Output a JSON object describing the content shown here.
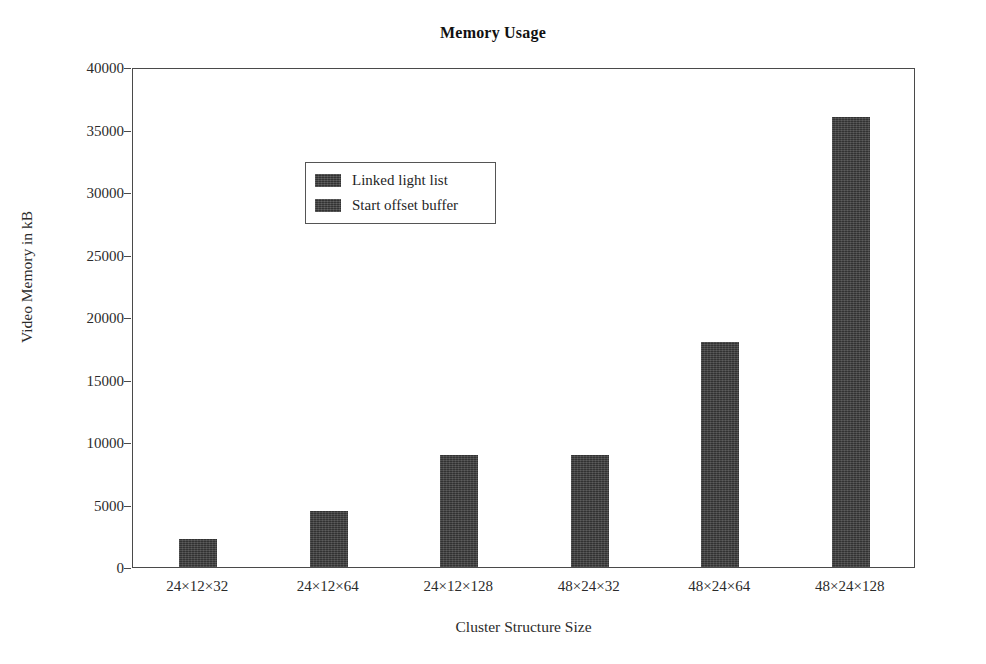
{
  "chart_data": {
    "type": "bar",
    "title": "Memory Usage",
    "xlabel": "Cluster Structure Size",
    "ylabel": "Video Memory in kB",
    "categories": [
      "24×12×32",
      "24×12×64",
      "24×12×128",
      "48×24×32",
      "48×24×64",
      "48×24×128"
    ],
    "series": [
      {
        "name": "Linked light list",
        "values": [
          2250,
          4500,
          9000,
          9000,
          18000,
          36000
        ]
      },
      {
        "name": "Start offset buffer",
        "values": [
          0,
          0,
          0,
          0,
          0,
          0
        ]
      }
    ],
    "values": [
      2250,
      4500,
      9000,
      9000,
      18000,
      36000
    ],
    "ylim": [
      0,
      40000
    ],
    "yticks": [
      0,
      5000,
      10000,
      15000,
      20000,
      25000,
      30000,
      35000,
      40000
    ],
    "ytick_labels": [
      "0",
      "5000",
      "10000",
      "15000",
      "20000",
      "25000",
      "30000",
      "35000",
      "40000"
    ],
    "grid": false,
    "legend_position": "upper left",
    "bar_color": "#3d3d3d",
    "axis_color": "#4a4a4a",
    "background_color": "#ffffff"
  },
  "legend": {
    "items": [
      {
        "label": "Linked light list",
        "color": "#3d3d3d"
      },
      {
        "label": "Start offset buffer",
        "color": "#3d3d3d"
      }
    ]
  }
}
